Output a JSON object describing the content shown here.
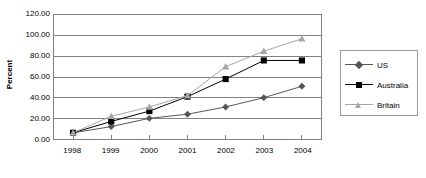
{
  "chart_data": {
    "type": "line",
    "title": "",
    "xlabel": "",
    "ylabel": "Percent",
    "categories": [
      "1998",
      "1999",
      "2000",
      "2001",
      "2002",
      "2003",
      "2004"
    ],
    "ylim": [
      0,
      120
    ],
    "y_ticks": [
      "0.00",
      "20.00",
      "40.00",
      "60.00",
      "80.00",
      "100.00",
      "120.00"
    ],
    "y_tick_values": [
      0,
      20,
      40,
      60,
      80,
      100,
      120
    ],
    "grid": "horizontal",
    "legend_position": "right",
    "series": [
      {
        "name": "US",
        "marker": "diamond",
        "color": "#555555",
        "values": [
          6,
          12,
          20,
          24,
          31,
          40,
          51
        ]
      },
      {
        "name": "Australia",
        "marker": "square",
        "color": "#000000",
        "values": [
          6,
          17,
          27,
          41,
          58,
          76,
          76
        ]
      },
      {
        "name": "Britain",
        "marker": "triangle",
        "color": "#a6a6a6",
        "values": [
          6,
          22,
          31,
          42,
          70,
          85,
          97
        ]
      }
    ]
  },
  "legend": {
    "items": [
      {
        "label": "US"
      },
      {
        "label": "Australia"
      },
      {
        "label": "Britain"
      }
    ]
  },
  "colors": {
    "plot_border": "#808080",
    "gridline": "#808080",
    "legend_border": "#9a9a9a",
    "background": "#ffffff",
    "text": "#000000"
  }
}
